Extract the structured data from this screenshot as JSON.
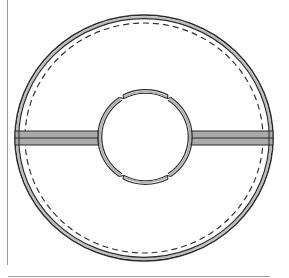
{
  "figure": {
    "type": "technical-drawing",
    "caption_fragment": "",
    "colors": {
      "line": "#2a2a2a",
      "ring_fill": "#bdbdbd",
      "spoke_fill": "#a9a9a9",
      "dashed": "#333333",
      "page_rule": "#9a9a9a"
    },
    "outer_ring": {
      "cx": 144,
      "cy": 138,
      "rx": 129,
      "ry": 123,
      "band": 4
    },
    "dashed_circle": {
      "cx": 144,
      "cy": 138,
      "rx": 119,
      "ry": 115
    },
    "inner_hub": {
      "cx": 145,
      "cy": 137,
      "r": 47,
      "notches": 4
    },
    "spokes": [
      {
        "side": "left",
        "x1": 14,
        "x2": 98,
        "y_top": 131,
        "y_bottom": 145
      },
      {
        "side": "right",
        "x1": 192,
        "x2": 274,
        "y_top": 131,
        "y_bottom": 145
      }
    ]
  }
}
